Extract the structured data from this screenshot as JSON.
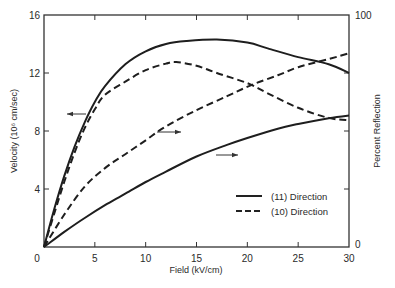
{
  "chart_data": {
    "type": "line",
    "title": "",
    "xlabel": "Field (kV/cm)",
    "ylabel": "Velocity (10^6 cm/sec)",
    "ylabel_display": "Velocity (10⁶ cm/sec)",
    "y2label": "Percent Reflection",
    "xlim": [
      0,
      30
    ],
    "ylim": [
      0,
      16
    ],
    "y2lim": [
      0,
      100
    ],
    "x_ticks": [
      0,
      5,
      10,
      15,
      20,
      25,
      30
    ],
    "y_ticks": [
      0,
      4,
      8,
      12,
      16
    ],
    "y2_ticks": [
      0,
      100
    ],
    "y2_minor_ticks": [
      25,
      50,
      75
    ],
    "grid": false,
    "legend": {
      "position": "lower right",
      "entries": [
        {
          "label": "(11) Direction",
          "style": "solid"
        },
        {
          "label": "(10) Direction",
          "style": "dashed"
        }
      ]
    },
    "series": [
      {
        "name": "Velocity (11) Direction",
        "axis": "left",
        "style": "solid",
        "x": [
          0,
          1,
          2,
          3,
          4,
          5,
          6,
          8,
          10,
          12,
          14,
          17,
          20,
          22,
          25,
          28,
          30
        ],
        "y": [
          0,
          2.6,
          4.9,
          6.9,
          8.6,
          10.0,
          11.1,
          12.6,
          13.5,
          14.0,
          14.2,
          14.3,
          14.1,
          13.7,
          13.1,
          12.6,
          12.0
        ]
      },
      {
        "name": "Velocity (10) Direction",
        "axis": "left",
        "style": "dashed",
        "x": [
          0,
          1,
          2,
          3,
          4,
          5,
          6,
          8,
          10,
          12,
          13,
          15,
          17,
          20,
          22,
          25,
          28,
          30
        ],
        "y": [
          0,
          2.3,
          4.5,
          6.5,
          8.2,
          9.5,
          10.5,
          11.4,
          12.2,
          12.65,
          12.75,
          12.5,
          12.0,
          11.3,
          10.6,
          9.6,
          8.9,
          8.75
        ]
      },
      {
        "name": "Percent Reflection (10) Direction",
        "axis": "right",
        "style": "dashed",
        "x": [
          0,
          2,
          4,
          6,
          8,
          10,
          12,
          15,
          18,
          20.5,
          23,
          25,
          28,
          30
        ],
        "y": [
          0,
          14,
          26,
          34,
          40,
          46,
          52,
          59,
          65,
          70,
          74,
          77.5,
          81,
          83.5
        ]
      },
      {
        "name": "Percent Reflection (11) Direction",
        "axis": "right",
        "style": "solid",
        "x": [
          0,
          2,
          4,
          6,
          8,
          10,
          12,
          15,
          18,
          20,
          23,
          25,
          28,
          30
        ],
        "y": [
          0,
          6.5,
          12.5,
          18,
          23,
          28,
          32.5,
          39,
          44,
          47,
          51,
          53,
          55.5,
          56.7
        ]
      }
    ],
    "annotations": [
      {
        "type": "arrow",
        "direction": "left",
        "points_to": "velocity axis",
        "at": [
          3.9,
          9.2
        ]
      },
      {
        "type": "arrow",
        "direction": "right",
        "points_to": "reflection axis",
        "at": [
          12.5,
          50
        ]
      },
      {
        "type": "arrow",
        "direction": "right",
        "points_to": "reflection axis",
        "at": [
          18.5,
          39.5
        ]
      }
    ]
  }
}
